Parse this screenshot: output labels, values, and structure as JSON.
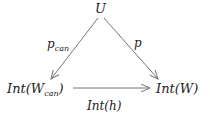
{
  "diagram": {
    "type": "commutative-diagram",
    "nodes": {
      "top": {
        "label": "U"
      },
      "bottom_left": {
        "label_main": "Int(W",
        "label_sub": "can",
        "label_close": ")"
      },
      "bottom_right": {
        "label": "Int(W)"
      }
    },
    "edges": {
      "left": {
        "label_main": "p",
        "label_sub": "can",
        "from": "U",
        "to": "Int(W_can)"
      },
      "right": {
        "label": "p",
        "from": "U",
        "to": "Int(W)"
      },
      "bottom": {
        "label": "Int(h)",
        "from": "Int(W_can)",
        "to": "Int(W)"
      }
    },
    "colors": {
      "line": "#777777",
      "text": "#222222"
    }
  }
}
